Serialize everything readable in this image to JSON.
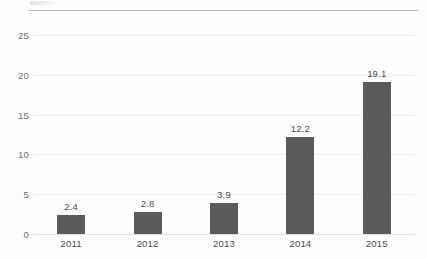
{
  "chart_data": {
    "type": "bar",
    "title": "",
    "subtitle": "",
    "xlabel": "",
    "ylabel": "",
    "categories": [
      "2011",
      "2012",
      "2013",
      "2014",
      "2015"
    ],
    "values": [
      2.4,
      2.8,
      3.9,
      12.2,
      19.1
    ],
    "data_labels": [
      "2.4",
      "2.8",
      "3.9",
      "12.2",
      "19.1"
    ],
    "ylim": [
      0,
      26.9
    ],
    "yticks": [
      0,
      5,
      10,
      15,
      20,
      25
    ],
    "ytick_labels": [
      "0",
      "5",
      "10",
      "15",
      "20",
      "25"
    ],
    "grid": true,
    "grid_axis": "y",
    "legend": false,
    "legend_position": "none",
    "series": [
      {
        "name": "",
        "values": [
          2.4,
          2.8,
          3.9,
          12.2,
          19.1
        ]
      }
    ],
    "colors": {
      "bar": "#5a5a5a",
      "gridline": "#ececec",
      "baseline": "#e2e2e2",
      "top_rule": "#b6b6b6",
      "tick_label": "#6d6d6d",
      "data_label": "#4a4a4a",
      "background": "#fdfdfd"
    }
  }
}
